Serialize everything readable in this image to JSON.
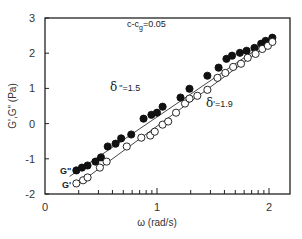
{
  "chart_data": {
    "type": "scatter",
    "title": "",
    "xlabel": "ω (rad/s)",
    "ylabel": "G',G\" (Pa)",
    "x_scale": "log10 (axis shows log ω)",
    "xlim": [
      0,
      2.19
    ],
    "ylim": [
      -2,
      3
    ],
    "x_ticks": [
      "0",
      "1",
      "2"
    ],
    "y_ticks": [
      "-2",
      "-1",
      "0",
      "1",
      "2",
      "3"
    ],
    "grid": false,
    "annotations": [
      {
        "id": "concentration",
        "text": "c-c",
        "subscript": "g",
        "suffix": "=0.05"
      },
      {
        "id": "delta-double-prime",
        "symbol": "δ",
        "text": "\"=1.5"
      },
      {
        "id": "delta-prime",
        "symbol": "δ",
        "text": "'=1.9"
      }
    ],
    "series": [
      {
        "name": "G\"",
        "label": "G\"",
        "marker": "filled-circle",
        "color": "#111111",
        "slope": 1.5,
        "x": [
          0.28,
          0.33,
          0.38,
          0.45,
          0.5,
          0.56,
          0.63,
          0.68,
          0.77,
          0.88,
          0.95,
          1.0,
          1.05,
          1.21,
          1.29,
          1.45,
          1.55,
          1.62,
          1.67,
          1.74,
          1.8,
          1.87,
          1.93,
          1.97,
          2.03
        ],
        "y": [
          -1.33,
          -1.25,
          -1.19,
          -1.08,
          -0.96,
          -0.65,
          -0.57,
          -0.42,
          -0.31,
          0.14,
          0.25,
          0.31,
          0.48,
          0.74,
          0.99,
          1.36,
          1.59,
          1.84,
          1.93,
          2.01,
          2.07,
          2.15,
          2.27,
          2.35,
          2.44
        ],
        "fit_line": {
          "x": [
            0.22,
            2.06
          ],
          "y": [
            -1.5,
            2.48
          ]
        }
      },
      {
        "name": "G'",
        "label": "G'",
        "marker": "open-circle",
        "color": "#111111",
        "slope": 1.9,
        "x": [
          0.28,
          0.34,
          0.38,
          0.49,
          0.55,
          0.73,
          0.86,
          0.94,
          0.98,
          1.05,
          1.1,
          1.17,
          1.25,
          1.29,
          1.36,
          1.45,
          1.54,
          1.61,
          1.68,
          1.75,
          1.81,
          1.88,
          1.94,
          1.99,
          2.03
        ],
        "y": [
          -1.7,
          -1.61,
          -1.53,
          -1.25,
          -1.08,
          -0.65,
          -0.4,
          -0.34,
          -0.23,
          -0.03,
          0.06,
          0.31,
          0.57,
          0.71,
          0.79,
          0.96,
          1.3,
          1.44,
          1.61,
          1.7,
          1.87,
          1.98,
          2.12,
          2.21,
          2.32
        ],
        "fit_line": {
          "x": [
            0.26,
            2.06
          ],
          "y": [
            -1.8,
            2.4
          ]
        }
      }
    ]
  }
}
